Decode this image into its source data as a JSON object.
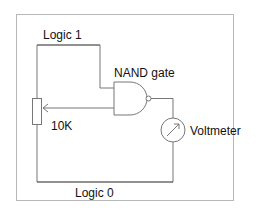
{
  "diagram": {
    "labels": {
      "logic1": "Logic 1",
      "logic0": "Logic 0",
      "gate": "NAND gate",
      "resistor": "10K",
      "meter": "Voltmeter"
    },
    "colors": {
      "frame": "#b8b8b8",
      "wire_dark": "#222222",
      "wire_light": "#8a8a8a",
      "text": "#111111"
    },
    "components": [
      {
        "type": "potentiometer",
        "label": "10K"
      },
      {
        "type": "nand-gate",
        "label": "NAND gate",
        "inputs": 2
      },
      {
        "type": "voltmeter",
        "label": "Voltmeter"
      }
    ],
    "rails": [
      {
        "name": "Logic 1",
        "position": "top"
      },
      {
        "name": "Logic 0",
        "position": "bottom"
      }
    ]
  }
}
